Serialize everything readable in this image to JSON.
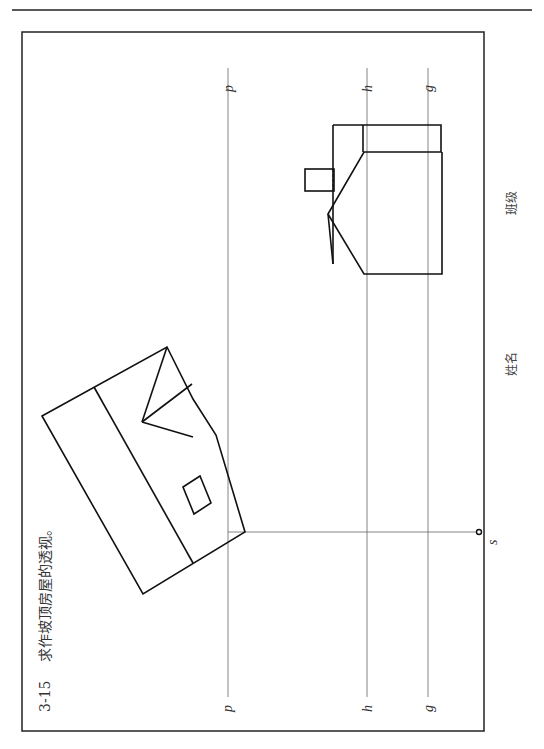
{
  "exercise": {
    "number": "3-15",
    "title": "求作坡顶房屋的透视。"
  },
  "labels": {
    "picture_plane": "p",
    "horizon_line": "h",
    "ground_line": "g",
    "station_point": "s"
  },
  "footer": {
    "name_label": "姓名",
    "class_label": "班级"
  },
  "colors": {
    "line": "#111111",
    "thin_line": "#666666",
    "frame": "#222222"
  }
}
